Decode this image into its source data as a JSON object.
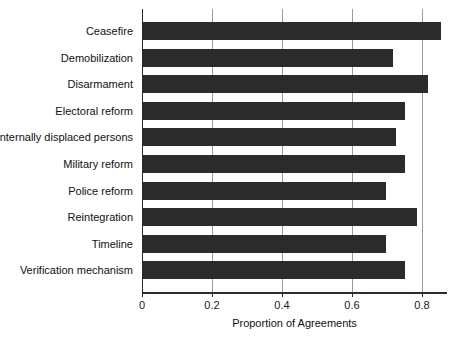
{
  "chart_data": {
    "type": "bar",
    "orientation": "horizontal",
    "title": "",
    "xlabel": "Proportion of Agreements",
    "ylabel": "",
    "xlim": [
      0,
      0.871
    ],
    "xticks": [
      0,
      0.2,
      0.4,
      0.6,
      0.8
    ],
    "xtick_labels": [
      "0",
      "0.2",
      "0.4",
      "0.6",
      "0.8"
    ],
    "grid": "vertical",
    "legend": "none",
    "bar_color": "#2b2b2b",
    "gridline_color": "#9a9a9a",
    "axis_color": "#2b2b2b",
    "categories": [
      "Ceasefire",
      "Demobilization",
      "Disarmament",
      "Electoral reform",
      "Internally displaced persons",
      "Military reform",
      "Police reform",
      "Reintegration",
      "Timeline",
      "Verification mechanism"
    ],
    "values": [
      0.855,
      0.718,
      0.817,
      0.75,
      0.726,
      0.75,
      0.697,
      0.786,
      0.697,
      0.751
    ]
  }
}
